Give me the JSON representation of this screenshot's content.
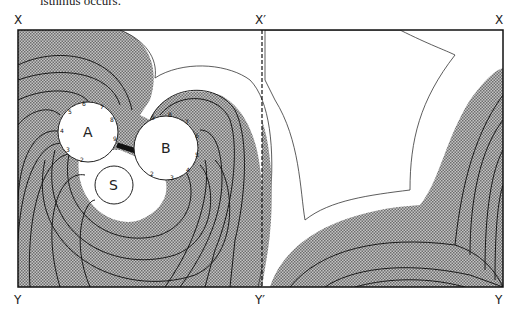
{
  "caption": "isthmus occurs.",
  "labels": {
    "top_left": "X",
    "top_mid": "X′",
    "top_right": "X",
    "bottom_left": "Y",
    "bottom_mid": "Y′",
    "bottom_right": "Y"
  },
  "regions": {
    "circle_a": "A",
    "circle_b": "B",
    "circle_s": "S"
  },
  "circle_a_numbers": [
    "2",
    "3",
    "4",
    "5",
    "6",
    "7",
    "8",
    "9"
  ],
  "circle_b_numbers": [
    "2",
    "3",
    "4",
    "5",
    "6",
    "7",
    "8",
    "9"
  ],
  "colors": {
    "shade": "#9a9a9a",
    "line": "#1a1a1a",
    "background": "#ffffff"
  }
}
